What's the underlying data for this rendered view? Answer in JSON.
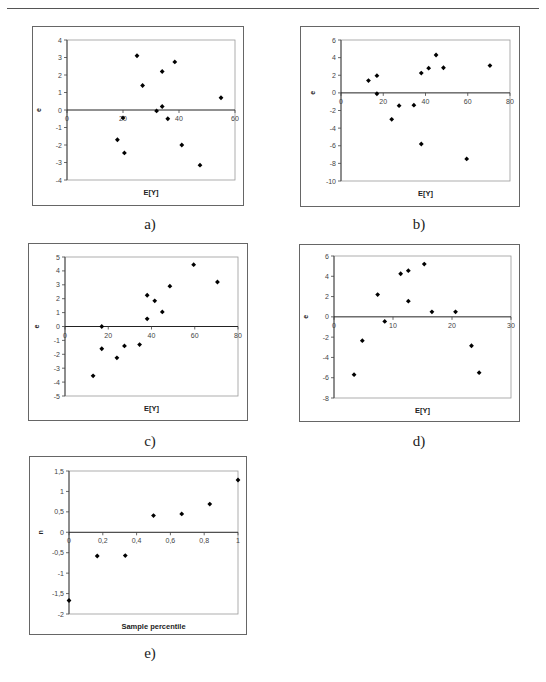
{
  "page": {
    "captions": [
      "a)",
      "b)",
      "c)",
      "d)",
      "e)"
    ]
  },
  "chart_data": [
    {
      "id": "a",
      "type": "scatter",
      "title": "",
      "xlabel": "E[Y]",
      "ylabel": "e",
      "xlim": [
        0,
        60
      ],
      "ylim": [
        -4,
        4
      ],
      "xticks": [
        0,
        20,
        40,
        60
      ],
      "yticks": [
        -4,
        -3,
        -2,
        -1,
        0,
        1,
        2,
        3,
        4
      ],
      "grid": false,
      "legend": null,
      "points": [
        [
          18,
          -1.7
        ],
        [
          20,
          -0.45
        ],
        [
          20.5,
          -2.45
        ],
        [
          25,
          3.1
        ],
        [
          27,
          1.4
        ],
        [
          32,
          -0.05
        ],
        [
          34,
          2.2
        ],
        [
          34,
          0.2
        ],
        [
          36,
          -0.5
        ],
        [
          38.5,
          2.75
        ],
        [
          41,
          -2
        ],
        [
          47.5,
          -3.15
        ],
        [
          55,
          0.7
        ]
      ]
    },
    {
      "id": "b",
      "type": "scatter",
      "title": "",
      "xlabel": "E[Y]",
      "ylabel": "e",
      "xlim": [
        0,
        80
      ],
      "ylim": [
        -10,
        6
      ],
      "xticks": [
        0,
        20,
        40,
        60,
        80
      ],
      "yticks": [
        -10,
        -8,
        -6,
        -4,
        -2,
        0,
        2,
        4,
        6
      ],
      "grid": false,
      "legend": null,
      "points": [
        [
          13,
          1.4
        ],
        [
          17,
          1.95
        ],
        [
          17,
          -0.1
        ],
        [
          24,
          -3
        ],
        [
          27.5,
          -1.45
        ],
        [
          34.5,
          -1.4
        ],
        [
          38,
          2.25
        ],
        [
          38,
          -5.8
        ],
        [
          41.5,
          2.8
        ],
        [
          45,
          4.3
        ],
        [
          48.5,
          2.85
        ],
        [
          59.5,
          -7.5
        ],
        [
          70.5,
          3.1
        ]
      ]
    },
    {
      "id": "c",
      "type": "scatter",
      "title": "",
      "xlabel": "E[Y]",
      "ylabel": "e",
      "xlim": [
        0,
        80
      ],
      "ylim": [
        -5,
        5
      ],
      "xticks": [
        0,
        20,
        40,
        60,
        80
      ],
      "yticks": [
        -5,
        -4,
        -3,
        -2,
        -1,
        0,
        1,
        2,
        3,
        4,
        5
      ],
      "grid": false,
      "legend": null,
      "points": [
        [
          13,
          -3.55
        ],
        [
          17,
          0
        ],
        [
          17,
          -1.6
        ],
        [
          24,
          -2.25
        ],
        [
          27.5,
          -1.4
        ],
        [
          34.5,
          -1.3
        ],
        [
          38,
          2.25
        ],
        [
          38,
          0.55
        ],
        [
          41.5,
          1.85
        ],
        [
          45,
          1.05
        ],
        [
          48.5,
          2.9
        ],
        [
          59.5,
          4.45
        ],
        [
          70.5,
          3.2
        ]
      ]
    },
    {
      "id": "d",
      "type": "scatter",
      "title": "",
      "xlabel": "E[Y]",
      "ylabel": "e",
      "xlim": [
        0,
        30
      ],
      "ylim": [
        -8,
        6
      ],
      "xticks": [
        0,
        10,
        20,
        30
      ],
      "yticks": [
        -8,
        -6,
        -4,
        -2,
        0,
        2,
        4,
        6
      ],
      "grid": false,
      "legend": null,
      "points": [
        [
          3.4,
          -5.7
        ],
        [
          4.8,
          -2.35
        ],
        [
          7.4,
          2.2
        ],
        [
          8.6,
          -0.45
        ],
        [
          11.3,
          4.25
        ],
        [
          12.6,
          4.55
        ],
        [
          12.6,
          1.55
        ],
        [
          15.3,
          5.2
        ],
        [
          16.6,
          0.5
        ],
        [
          20.6,
          0.5
        ],
        [
          23.3,
          -2.85
        ],
        [
          24.6,
          -5.5
        ]
      ]
    },
    {
      "id": "e",
      "type": "scatter",
      "title": "",
      "xlabel": "Sample percentile",
      "ylabel": "n",
      "xlim": [
        0,
        1
      ],
      "ylim": [
        -2,
        1.5
      ],
      "xticks": [
        0,
        0.2,
        0.4,
        0.6,
        0.8,
        1
      ],
      "xtick_labels": [
        "0",
        "0,2",
        "0,4",
        "0,6",
        "0,8",
        "1"
      ],
      "yticks": [
        -2,
        -1.5,
        -1,
        -0.5,
        0,
        0.5,
        1,
        1.5
      ],
      "ytick_labels": [
        "-2",
        "-1,5",
        "-1",
        "-0,5",
        "0",
        "0,5",
        "1",
        "1,5"
      ],
      "grid": false,
      "legend": null,
      "points": [
        [
          0,
          -1.67
        ],
        [
          0.167,
          -0.58
        ],
        [
          0.333,
          -0.57
        ],
        [
          0.5,
          0.41
        ],
        [
          0.667,
          0.45
        ],
        [
          0.833,
          0.69
        ],
        [
          1,
          1.28
        ]
      ]
    }
  ]
}
